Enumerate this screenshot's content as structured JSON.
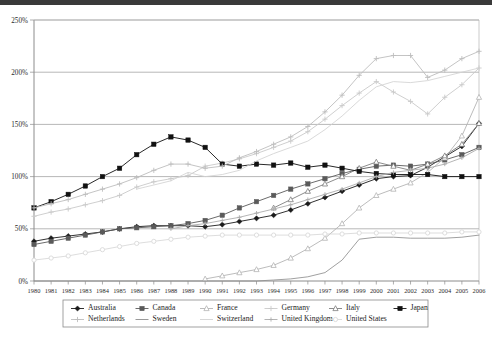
{
  "chart_data": {
    "type": "line",
    "title": "",
    "subtitle": "",
    "xlabel": "",
    "ylabel": "",
    "grid": true,
    "legend_position": "bottom",
    "xlim": [
      1980,
      2006
    ],
    "ylim": [
      0,
      250
    ],
    "y_ticks": [
      "0%",
      "50%",
      "100%",
      "150%",
      "200%",
      "250%"
    ],
    "y_tick_values": [
      0,
      50,
      100,
      150,
      200,
      250
    ],
    "x": [
      1980,
      1981,
      1982,
      1983,
      1984,
      1985,
      1986,
      1987,
      1988,
      1989,
      1990,
      1991,
      1992,
      1993,
      1994,
      1995,
      1996,
      1997,
      1998,
      1999,
      2000,
      2001,
      2002,
      2003,
      2004,
      2005,
      2006
    ],
    "categories": [
      "1980",
      "1981",
      "1982",
      "1983",
      "1984",
      "1985",
      "1986",
      "1987",
      "1988",
      "1989",
      "1990",
      "1991",
      "1992",
      "1993",
      "1994",
      "1995",
      "1996",
      "1997",
      "1998",
      "1999",
      "2000",
      "2001",
      "2002",
      "2003",
      "2004",
      "2005",
      "2006"
    ],
    "series": [
      {
        "name": "Australia",
        "marker": "diamond",
        "color": "#1a1a1a",
        "values": [
          38,
          41,
          43,
          45,
          47,
          50,
          52,
          53,
          53,
          53,
          52,
          54,
          57,
          60,
          63,
          68,
          74,
          80,
          86,
          92,
          98,
          100,
          101,
          109,
          119,
          129,
          151
        ]
      },
      {
        "name": "Canada",
        "marker": "square",
        "color": "#5a5a5a",
        "values": [
          35,
          38,
          41,
          44,
          47,
          50,
          51,
          52,
          53,
          55,
          58,
          63,
          70,
          76,
          82,
          88,
          93,
          98,
          103,
          107,
          110,
          111,
          110,
          112,
          116,
          121,
          128
        ]
      },
      {
        "name": "France",
        "marker": "triangle",
        "color": "#b4b4b4",
        "values": [
          null,
          null,
          null,
          null,
          null,
          null,
          null,
          null,
          null,
          null,
          2,
          5,
          8,
          11,
          15,
          22,
          31,
          41,
          55,
          70,
          82,
          88,
          94,
          104,
          118,
          139,
          176
        ]
      },
      {
        "name": "Germany",
        "marker": "cross",
        "color": "#c9c9c9",
        "values": [
          62,
          66,
          69,
          73,
          77,
          82,
          90,
          95,
          98,
          101,
          110,
          113,
          117,
          122,
          128,
          134,
          143,
          155,
          168,
          180,
          191,
          181,
          172,
          160,
          176,
          188,
          204
        ]
      },
      {
        "name": "Italy",
        "marker": "triangle",
        "color": "#7f7f7f",
        "values": [
          null,
          null,
          null,
          null,
          null,
          null,
          null,
          null,
          null,
          null,
          null,
          null,
          null,
          null,
          70,
          78,
          86,
          93,
          100,
          108,
          114,
          110,
          106,
          112,
          120,
          131,
          151
        ]
      },
      {
        "name": "Japan",
        "marker": "square-filled",
        "color": "#111111",
        "values": [
          70,
          76,
          83,
          91,
          100,
          108,
          121,
          131,
          138,
          135,
          128,
          112,
          110,
          112,
          111,
          113,
          109,
          111,
          108,
          105,
          103,
          102,
          102,
          102,
          100,
          100,
          100
        ]
      },
      {
        "name": "Netherlands",
        "marker": "plus",
        "color": "#bdbdbd",
        "values": [
          70,
          74,
          78,
          83,
          88,
          93,
          99,
          106,
          112,
          112,
          108,
          110,
          118,
          124,
          131,
          138,
          148,
          162,
          178,
          197,
          213,
          216,
          216,
          195,
          202,
          213,
          220
        ]
      },
      {
        "name": "Sweden",
        "marker": "line-only",
        "color": "#8f8f8f",
        "values": [
          0,
          0,
          0,
          0,
          0,
          0,
          0,
          0,
          0,
          0,
          0,
          0,
          0,
          0,
          1,
          2,
          4,
          8,
          20,
          40,
          42,
          42,
          41,
          41,
          41,
          42,
          44
        ]
      },
      {
        "name": "Switzerland",
        "marker": "line-only",
        "color": "#d2d2d2",
        "values": [
          null,
          null,
          null,
          null,
          null,
          null,
          88,
          92,
          96,
          104,
          100,
          102,
          106,
          115,
          122,
          128,
          134,
          145,
          158,
          173,
          186,
          191,
          190,
          192,
          196,
          200,
          204
        ]
      },
      {
        "name": "United Kingdom",
        "marker": "plus-small",
        "color": "#adadad",
        "values": [
          null,
          null,
          null,
          null,
          null,
          null,
          null,
          null,
          50,
          53,
          55,
          58,
          61,
          65,
          69,
          73,
          78,
          83,
          88,
          94,
          100,
          104,
          106,
          108,
          112,
          118,
          127
        ]
      },
      {
        "name": "United States",
        "marker": "circle-open",
        "color": "#d9d9d9",
        "values": [
          20,
          22,
          24,
          27,
          30,
          33,
          36,
          38,
          40,
          42,
          43,
          44,
          44,
          44,
          44,
          44,
          44,
          45,
          45,
          46,
          46,
          46,
          46,
          46,
          46,
          47,
          47
        ]
      }
    ]
  },
  "legend": {
    "row1": [
      {
        "label": "Australia"
      },
      {
        "label": "Canada"
      },
      {
        "label": "France"
      },
      {
        "label": "Germany"
      },
      {
        "label": "Italy"
      },
      {
        "label": "Japan"
      }
    ],
    "row2": [
      {
        "label": "Netherlands"
      },
      {
        "label": "Sweden"
      },
      {
        "label": "Switzerland"
      },
      {
        "label": "United Kingdom"
      },
      {
        "label": "United States"
      }
    ]
  }
}
